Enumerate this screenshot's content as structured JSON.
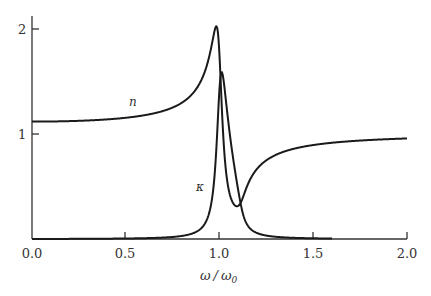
{
  "chart_data": {
    "type": "line",
    "title": "",
    "xlabel": "ω/ω₀",
    "ylabel": "",
    "xlim": [
      0.0,
      2.0
    ],
    "ylim": [
      0,
      2.1
    ],
    "grid": false,
    "legend": "none (inline curve labels)",
    "x_ticks": [
      "0.0",
      "0.5",
      "1.0",
      "1.5",
      "2.0"
    ],
    "y_ticks": [
      "1",
      "2"
    ],
    "series": [
      {
        "name": "n",
        "label": "n",
        "x": [
          0.0,
          0.25,
          0.5,
          0.7,
          0.85,
          0.93,
          0.98,
          1.02,
          1.05,
          1.1,
          1.2,
          1.4,
          1.6,
          1.8,
          2.0
        ],
        "values": [
          1.12,
          1.13,
          1.16,
          1.24,
          1.4,
          1.62,
          2.02,
          1.2,
          0.55,
          0.33,
          0.55,
          0.78,
          0.86,
          0.91,
          0.94
        ]
      },
      {
        "name": "κ",
        "label": "κ",
        "x": [
          0.0,
          0.5,
          0.7,
          0.85,
          0.93,
          0.98,
          1.02,
          1.05,
          1.08,
          1.12,
          1.2,
          1.3,
          1.4,
          1.5
        ],
        "values": [
          0.0,
          0.0,
          0.02,
          0.08,
          0.25,
          0.9,
          1.53,
          1.3,
          0.8,
          0.3,
          0.1,
          0.04,
          0.01,
          0.0
        ]
      }
    ],
    "model": {
      "oscillator_strength": 0.25,
      "damping": 0.05
    }
  },
  "labels": {
    "x_axis_title_main": "ω",
    "x_axis_title_slash": "/",
    "x_axis_title_denom": "ω",
    "x_axis_title_sub": "0",
    "curve_n": "n",
    "curve_kappa": "κ",
    "x_tick_0": "0.0",
    "x_tick_1": "0.5",
    "x_tick_2": "1.0",
    "x_tick_3": "1.5",
    "x_tick_4": "2.0",
    "y_tick_1": "1",
    "y_tick_2": "2"
  },
  "colors": {
    "curve": "#1a1a1a",
    "axis": "#333333"
  }
}
